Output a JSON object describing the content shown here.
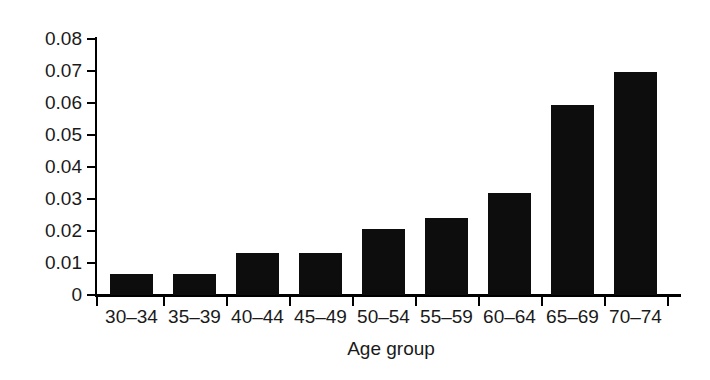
{
  "chart_data": {
    "type": "bar",
    "title": "",
    "subtitle": "",
    "xlabel": "Age group",
    "ylabel": "",
    "categories": [
      "30–34",
      "35–39",
      "40–44",
      "45–49",
      "50–54",
      "55–59",
      "60–64",
      "65–69",
      "70–74"
    ],
    "values": [
      0.0065,
      0.0065,
      0.0132,
      0.0132,
      0.0205,
      0.024,
      0.032,
      0.0594,
      0.0697
    ],
    "ylim": [
      0,
      0.08
    ],
    "ytick_values": [
      0,
      0.01,
      0.02,
      0.03,
      0.04,
      0.05,
      0.06,
      0.07,
      0.08
    ],
    "ytick_labels": [
      "0",
      "0.01",
      "0.02",
      "0.03",
      "0.04",
      "0.05",
      "0.06",
      "0.07",
      "0.08"
    ],
    "grid": false,
    "legend": false,
    "legend_position": "none",
    "bar_color": "#0d0d0d",
    "axis_color": "#000000",
    "background_color": "#ffffff"
  }
}
